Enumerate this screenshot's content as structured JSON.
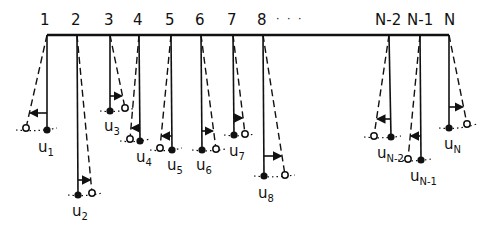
{
  "diagram": {
    "dots": "· · ·",
    "colors": {
      "ink": "#111111",
      "background": "#ffffff"
    },
    "bar": {
      "x1": 47,
      "x2": 449,
      "y": 35
    },
    "pendulums": [
      {
        "label": "1",
        "u_label": "u",
        "u_sub": "1",
        "pivot_x": 47,
        "mass": [
          47,
          130
        ],
        "open": [
          26,
          128
        ],
        "arrow_y": 113,
        "label_x": 40,
        "u_pos": [
          38,
          140
        ]
      },
      {
        "label": "2",
        "u_label": "u",
        "u_sub": "2",
        "pivot_x": 77,
        "mass": [
          78,
          195
        ],
        "open": [
          92,
          193
        ],
        "arrow_y": 180,
        "label_x": 71,
        "u_pos": [
          72,
          204
        ]
      },
      {
        "label": "3",
        "u_label": "u",
        "u_sub": "3",
        "pivot_x": 110,
        "mass": [
          110,
          111
        ],
        "open": [
          125,
          108
        ],
        "arrow_y": 96,
        "label_x": 104,
        "u_pos": [
          104,
          119
        ]
      },
      {
        "label": "4",
        "u_label": "u",
        "u_sub": "4",
        "pivot_x": 139,
        "mass": [
          140,
          141
        ],
        "open": [
          130,
          139
        ],
        "arrow_y": 128,
        "label_x": 133,
        "u_pos": [
          136,
          150
        ]
      },
      {
        "label": "5",
        "u_label": "u",
        "u_sub": "5",
        "pivot_x": 171,
        "mass": [
          172,
          150
        ],
        "open": [
          160,
          148
        ],
        "arrow_y": 136,
        "label_x": 165,
        "u_pos": [
          167,
          158
        ]
      },
      {
        "label": "6",
        "u_label": "u",
        "u_sub": "6",
        "pivot_x": 201,
        "mass": [
          202,
          150
        ],
        "open": [
          216,
          149
        ],
        "arrow_y": 131,
        "label_x": 195,
        "u_pos": [
          196,
          158
        ]
      },
      {
        "label": "7",
        "u_label": "u",
        "u_sub": "7",
        "pivot_x": 233,
        "mass": [
          234,
          135
        ],
        "open": [
          245,
          134
        ],
        "arrow_y": 118,
        "label_x": 227,
        "u_pos": [
          229,
          144
        ]
      },
      {
        "label": "8",
        "u_label": "u",
        "u_sub": "8",
        "pivot_x": 263,
        "mass": [
          264,
          176
        ],
        "open": [
          285,
          175
        ],
        "arrow_y": 156,
        "label_x": 257,
        "u_pos": [
          258,
          186
        ]
      },
      {
        "label": "N-2",
        "u_label": "u",
        "u_sub": "N-2",
        "pivot_x": 389,
        "mass": [
          391,
          137
        ],
        "open": [
          374,
          136
        ],
        "arrow_y": 119,
        "label_x": 375,
        "u_pos": [
          377,
          146
        ]
      },
      {
        "label": "N-1",
        "u_label": "u",
        "u_sub": "N-1",
        "pivot_x": 420,
        "mass": [
          421,
          160
        ],
        "open": [
          408,
          159
        ],
        "arrow_y": 136,
        "label_x": 407,
        "u_pos": [
          410,
          169
        ]
      },
      {
        "label": "N",
        "u_label": "u",
        "u_sub": "N",
        "pivot_x": 449,
        "mass": [
          449,
          128
        ],
        "open": [
          467,
          124
        ],
        "arrow_y": 107,
        "label_x": 444,
        "u_pos": [
          444,
          137
        ]
      }
    ]
  }
}
